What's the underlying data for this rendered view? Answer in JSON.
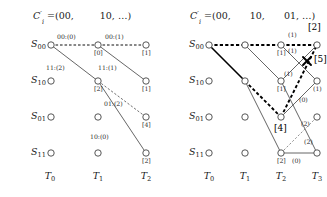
{
  "figure": {
    "panels": [
      {
        "id": "left",
        "title_prefix": "C",
        "title_prime": "′",
        "title_sub": "i",
        "title_body": "=(00,",
        "title_parts": [
          "=(00,",
          "10, …)"
        ],
        "title_text": "C′i =(00,      10, …)",
        "state_labels": [
          "S00",
          "S10",
          "S01",
          "S11"
        ],
        "state_label_bases": [
          "S",
          "S",
          "S",
          "S"
        ],
        "state_label_subs": [
          "00",
          "10",
          "01",
          "11"
        ],
        "time_labels": [
          "T0",
          "T1",
          "T2"
        ],
        "time_label_subs": [
          "0",
          "1",
          "2"
        ],
        "edge_labels": [
          {
            "text": "00:(0)",
            "x": 39,
            "y": 36
          },
          {
            "text": "00:(1)",
            "x": 90,
            "y": 36
          },
          {
            "text": "11:(2)",
            "x": 34,
            "y": 68
          },
          {
            "text": "11:(1)",
            "x": 85,
            "y": 68
          },
          {
            "text": "01:(2)",
            "x": 93,
            "y": 103
          },
          {
            "text": "10:(0)",
            "x": 81,
            "y": 136
          }
        ],
        "node_labels": [
          {
            "text": "[0]",
            "x": 64,
            "y": 52
          },
          {
            "text": "[1]",
            "x": 113,
            "y": 52
          },
          {
            "text": "[2]",
            "x": 64,
            "y": 88
          },
          {
            "text": "[1]",
            "x": 113,
            "y": 88
          },
          {
            "text": "[4]",
            "x": 113,
            "y": 124
          },
          {
            "text": "[2]",
            "x": 113,
            "y": 160
          }
        ]
      },
      {
        "id": "right",
        "title_parts": [
          "=(00,",
          "10,",
          "01, …)"
        ],
        "title_text": "C′i =(00,    10,    01, …)",
        "state_labels": [
          "S00",
          "S10",
          "S01",
          "S11"
        ],
        "state_label_subs": [
          "00",
          "10",
          "01",
          "11"
        ],
        "time_labels": [
          "T0",
          "T1",
          "T2",
          "T3"
        ],
        "time_label_subs": [
          "0",
          "1",
          "2",
          "3"
        ],
        "edge_labels": [
          {
            "text": "(1)",
            "x": 93,
            "y": 33
          },
          {
            "text": "(1)",
            "x": 93,
            "y": 47
          },
          {
            "text": "(1)",
            "x": 84,
            "y": 73
          },
          {
            "text": "(0)",
            "x": 107,
            "y": 99
          },
          {
            "text": "(2)",
            "x": 107,
            "y": 122
          },
          {
            "text": "(2)",
            "x": 110,
            "y": 140
          },
          {
            "text": "(0)",
            "x": 88,
            "y": 165
          }
        ],
        "node_labels": [
          {
            "text": "[1]",
            "x": 84,
            "y": 52
          },
          {
            "text": "[1]",
            "x": 84,
            "y": 88
          },
          {
            "text": "[2]",
            "x": 84,
            "y": 160
          },
          {
            "text": "(1)",
            "x": 117,
            "y": 88
          }
        ],
        "node_labels_big": [
          {
            "text": "[2]",
            "x": 111,
            "y": 17
          },
          {
            "text": "[5]",
            "x": 123,
            "y": 47
          },
          {
            "text": "[4]",
            "x": 78,
            "y": 128
          }
        ],
        "cross_marker": "x-mark-icon"
      }
    ],
    "colors": {
      "node_stroke": "#444444",
      "edge_solid": "#555555",
      "edge_dashed": "#000000",
      "edge_bold": "#000000",
      "text": "#1a1a1a"
    }
  }
}
